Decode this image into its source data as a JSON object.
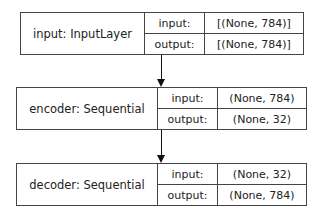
{
  "nodes": [
    {
      "name": "input: InputLayer",
      "input_label": "input:",
      "input_value": "[(None, 784)]",
      "output_label": "output:",
      "output_value": "[(None, 784)]"
    },
    {
      "name": "encoder: Sequential",
      "input_label": "input:",
      "input_value": "(None, 784)",
      "output_label": "output:",
      "output_value": "(None, 32)"
    },
    {
      "name": "decoder: Sequential",
      "input_label": "input:",
      "input_value": "(None, 32)",
      "output_label": "output:",
      "output_value": "(None, 784)"
    }
  ],
  "edges": [
    {
      "from": "input: InputLayer",
      "to": "encoder: Sequential"
    },
    {
      "from": "encoder: Sequential",
      "to": "decoder: Sequential"
    }
  ]
}
